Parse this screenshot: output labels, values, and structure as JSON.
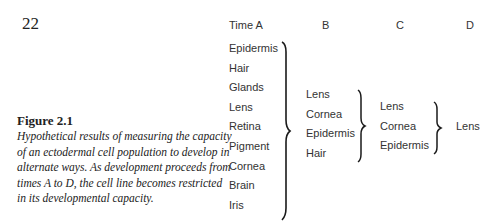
{
  "page": {
    "number": "22"
  },
  "figure": {
    "label": "Figure 2.1",
    "caption": "Hypothetical results of measuring the capacity of an ectodermal cell population to develop in alternate ways. As development proceeds from times A to D, the cell line becomes restricted in its developmental capacity."
  },
  "table": {
    "headers": [
      "Time A",
      "B",
      "C",
      "D"
    ],
    "columns": [
      {
        "time": "A",
        "items": [
          "Epidermis",
          "Hair",
          "Glands",
          "Lens",
          "Retina",
          "Pigment",
          "Cornea",
          "Brain",
          "Iris"
        ]
      },
      {
        "time": "B",
        "items": [
          "Lens",
          "Cornea",
          "Epidermis",
          "Hair"
        ]
      },
      {
        "time": "C",
        "items": [
          "Lens",
          "Cornea",
          "Epidermis"
        ]
      },
      {
        "time": "D",
        "items": [
          "Lens"
        ]
      }
    ]
  }
}
